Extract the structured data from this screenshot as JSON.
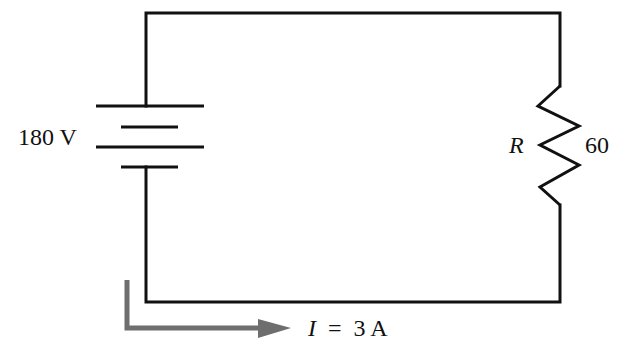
{
  "diagram": {
    "type": "electric-circuit",
    "battery": {
      "label": "180 V",
      "voltage_value": 180,
      "voltage_unit": "V"
    },
    "resistor": {
      "symbol": "R",
      "value_label": "60",
      "value": 60
    },
    "current": {
      "symbol": "I",
      "equals": "=",
      "value_label": "3 A",
      "value": 3,
      "unit": "A",
      "direction": "clockwise-from-battery-bottom-to-right"
    },
    "colors": {
      "wire": "#111111",
      "arrow": "#6e6e6e",
      "background": "#ffffff"
    }
  }
}
